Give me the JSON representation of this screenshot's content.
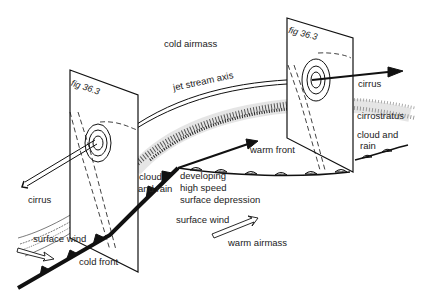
{
  "diagram": {
    "labels": {
      "cold_airmass": "cold airmass",
      "jet_stream_axis": "jet stream axis",
      "fig_left": "fig 36.3",
      "fig_right": "fig 36.3",
      "cirrus_right": "cirrus",
      "cirrostratus": "cirrostratus",
      "cloud_and_rain_right_1": "cloud and",
      "cloud_and_rain_right_2": "rain",
      "warm_front": "warm front",
      "cloud_and_rain_left_1": "cloud",
      "cloud_and_rain_left_2": "and rain",
      "developing_1": "developing",
      "developing_2": "high speed",
      "developing_3": "surface depression",
      "surface_wind_center": "surface wind",
      "warm_airmass": "warm airmass",
      "cirrus_left": "cirrus",
      "surface_wind_left": "surface wind",
      "cold_front": "cold front"
    },
    "colors": {
      "ink": "#1a1a1a",
      "background": "#ffffff"
    }
  }
}
